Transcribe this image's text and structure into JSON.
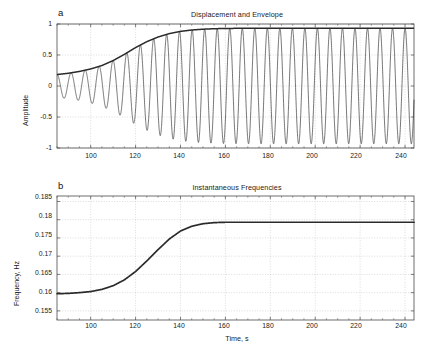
{
  "figure": {
    "background": "#ffffff",
    "line_color": "#2b2b2b",
    "grid_color": "#b9b9b9",
    "axis_color": "#4a4a4a"
  },
  "panel_a": {
    "letter": "a",
    "title": "Displacement and Envelope",
    "ylabel": "Amplitude",
    "xlabel": "",
    "y_ticks": [
      "1",
      "0.5",
      "0",
      "-0.5",
      "-1"
    ],
    "x_ticks": [
      "100",
      "120",
      "140",
      "160",
      "180",
      "200",
      "220",
      "240"
    ]
  },
  "panel_b": {
    "letter": "b",
    "title": "Instantaneous Frequencies",
    "ylabel": "Frequency, Hz",
    "xlabel": "Time, s",
    "y_ticks": [
      "0.185",
      "0.18",
      "0.175",
      "0.17",
      "0.165",
      "0.16",
      "0.155"
    ],
    "x_ticks": [
      "100",
      "120",
      "140",
      "160",
      "180",
      "200",
      "220",
      "240"
    ]
  },
  "chart_data": [
    {
      "type": "line",
      "id": "displacement-and-envelope",
      "panel": "a",
      "title": "Displacement and Envelope",
      "xlabel": "",
      "ylabel": "Amplitude",
      "xlim": [
        85,
        244
      ],
      "ylim": [
        -1,
        1
      ],
      "xticks": [
        100,
        120,
        140,
        160,
        180,
        200,
        220,
        240
      ],
      "yticks": [
        -1,
        -0.5,
        0,
        0.5,
        1
      ],
      "grid": true,
      "legend": null,
      "description": "Amplitude-modulated chirp: oscillation whose envelope grows from about 0.18 at t=85 s and saturates near 0.93 after t=160 s; instantaneous frequency rises from 0.1597 Hz to 0.179 Hz.",
      "series": [
        {
          "name": "Envelope",
          "linewidth": 1.6,
          "model": {
            "kind": "logistic",
            "low": 0.18,
            "high": 0.932,
            "center": 122,
            "width": 13.5
          }
        },
        {
          "name": "Displacement",
          "linewidth": 0.7,
          "model": {
            "kind": "envelope_times_cosine",
            "phase_at_x0": 0.0,
            "phase_x0": 85
          }
        }
      ],
      "envelope_samples": {
        "x": [
          85,
          90,
          95,
          100,
          105,
          110,
          115,
          120,
          125,
          130,
          135,
          140,
          145,
          150,
          155,
          160,
          165,
          170,
          180,
          190,
          200,
          210,
          220,
          230,
          244
        ],
        "y": [
          0.185,
          0.205,
          0.235,
          0.275,
          0.33,
          0.41,
          0.51,
          0.62,
          0.715,
          0.79,
          0.845,
          0.881,
          0.903,
          0.916,
          0.924,
          0.928,
          0.93,
          0.931,
          0.932,
          0.932,
          0.932,
          0.932,
          0.932,
          0.932,
          0.932
        ]
      }
    },
    {
      "type": "line",
      "id": "instantaneous-frequencies",
      "panel": "b",
      "title": "Instantaneous Frequencies",
      "xlabel": "Time, s",
      "ylabel": "Frequency, Hz",
      "xlim": [
        85,
        244
      ],
      "ylim": [
        0.1525,
        0.1865
      ],
      "xticks": [
        100,
        120,
        140,
        160,
        180,
        200,
        220,
        240
      ],
      "yticks": [
        0.155,
        0.16,
        0.165,
        0.17,
        0.175,
        0.18,
        0.185
      ],
      "grid": true,
      "legend": null,
      "description": "Sigmoidal rise of instantaneous frequency from 0.1597 Hz to a plateau at about 0.179 Hz, transition centred near 128 s.",
      "series": [
        {
          "name": "Instantaneous frequency",
          "linewidth": 1.7,
          "x": [
            85,
            90,
            95,
            100,
            105,
            110,
            115,
            120,
            125,
            130,
            135,
            140,
            145,
            150,
            155,
            160,
            165,
            170,
            175,
            180,
            190,
            200,
            210,
            220,
            230,
            240,
            244
          ],
          "y": [
            0.1597,
            0.1598,
            0.16,
            0.1603,
            0.1609,
            0.1619,
            0.1635,
            0.1658,
            0.1687,
            0.1718,
            0.1747,
            0.1769,
            0.1782,
            0.1789,
            0.1792,
            0.1793,
            0.1793,
            0.1793,
            0.1793,
            0.1793,
            0.1793,
            0.1793,
            0.1793,
            0.1793,
            0.1793,
            0.1793,
            0.1793
          ]
        }
      ]
    }
  ]
}
